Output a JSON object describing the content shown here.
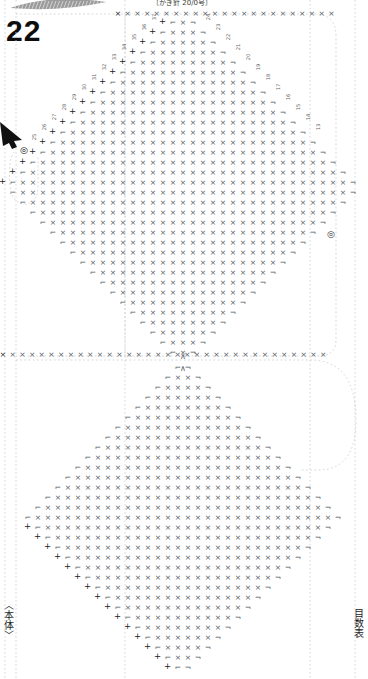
{
  "document": {
    "kind": "crochet-pattern-chart",
    "page_number": "22",
    "top_note": "〔かぎ針 20/0号〕",
    "body_label": "〈本体〉",
    "chart_label": "目数表",
    "bg_color": "#ffffff",
    "ink_color": "#555b63",
    "dark_ink_color": "#1a1a1a",
    "guide_color": "#c9cdd2"
  },
  "symbols": {
    "single_crochet": "×",
    "chain": "+",
    "increase_left": "⌐",
    "increase_right": "¬",
    "decrease_top": "∧"
  },
  "markers": {
    "start_arrow": "start-arrow",
    "start_ring": "◎",
    "side_ring": "◎"
  },
  "guides": {
    "vertical_x": [
      5,
      16,
      125,
      310,
      355
    ],
    "horizontal_y": [
      14,
      355
    ],
    "rounded_corner_radius": 26
  },
  "motifs": [
    {
      "name": "upper-diamond",
      "cx": 183,
      "top_y": 14,
      "bottom_y": 355,
      "half_width": 168,
      "rows": 34,
      "row_height": 10,
      "col_width": 10,
      "edge_numbers_left": [
        "37",
        "36",
        "35",
        "34",
        "33",
        "32",
        "31",
        "30",
        "29",
        "28",
        "27",
        "26",
        "25"
      ],
      "edge_numbers_right": [
        "24",
        "23",
        "22",
        "21",
        "20",
        "19",
        "18",
        "17",
        "16",
        "15",
        "14",
        "13"
      ]
    },
    {
      "name": "lower-diamond",
      "cx": 183,
      "top_y": 362,
      "bottom_y": 672,
      "half_width": 168,
      "rows": 31,
      "row_height": 10,
      "col_width": 10
    }
  ],
  "top_row": {
    "name": "foundation-row-top",
    "y": 14,
    "from_x": 118,
    "to_x": 340,
    "count": 23
  },
  "mid_row": {
    "name": "foundation-row-mid",
    "y": 355,
    "from_x": 3,
    "to_x": 322,
    "count": 33
  }
}
